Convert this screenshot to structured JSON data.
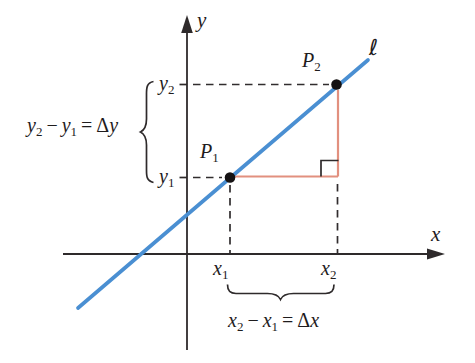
{
  "colors": {
    "line_blue": "#4a8fd2",
    "triangle_red": "#e2907f",
    "ink": "#2e2a2b"
  },
  "labels": {
    "y_axis": "y",
    "x_axis": "x",
    "line_name": "ℓ",
    "p1": {
      "base": "P",
      "sub": "1"
    },
    "p2": {
      "base": "P",
      "sub": "2"
    },
    "y2_tick": {
      "base": "y",
      "sub": "2"
    },
    "y1_tick": {
      "base": "y",
      "sub": "1"
    },
    "x1_tick": {
      "base": "x",
      "sub": "1"
    },
    "x2_tick": {
      "base": "x",
      "sub": "2"
    },
    "dy_equation": {
      "base1": "y",
      "sub1": "2",
      "minus": "−",
      "base2": "y",
      "sub2": "1",
      "equals": "=",
      "delta": "Δ",
      "var": "y"
    },
    "dx_equation": {
      "base1": "x",
      "sub1": "2",
      "minus": "−",
      "base2": "x",
      "sub2": "1",
      "equals": "=",
      "delta": "Δ",
      "var": "x"
    }
  }
}
